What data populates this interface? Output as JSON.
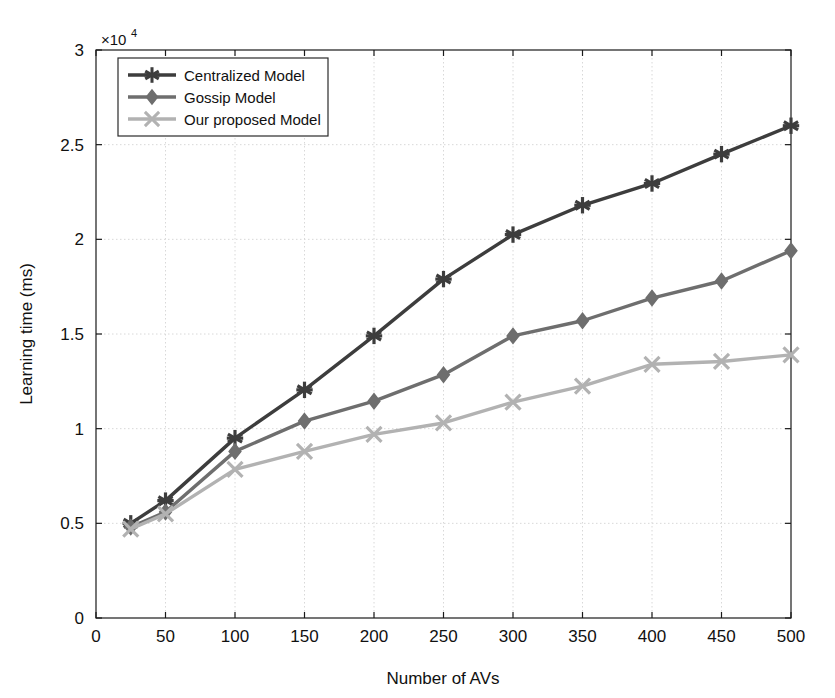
{
  "chart_data": {
    "type": "line",
    "title": "",
    "xlabel": "Number of AVs",
    "ylabel": "Learning time (ms)",
    "y_axis_exponent_label": "×10",
    "y_axis_exponent_power": "4",
    "xlim": [
      0,
      500
    ],
    "ylim": [
      0,
      30000
    ],
    "xticks": [
      0,
      50,
      100,
      150,
      200,
      250,
      300,
      350,
      400,
      450,
      500
    ],
    "xtick_labels": [
      "0",
      "50",
      "100",
      "150",
      "200",
      "250",
      "300",
      "350",
      "400",
      "450",
      "500"
    ],
    "yticks": [
      0,
      5000,
      10000,
      15000,
      20000,
      25000,
      30000
    ],
    "ytick_labels": [
      "0",
      "0.5",
      "1",
      "1.5",
      "2",
      "2.5",
      "3"
    ],
    "grid": true,
    "legend_position": "top-left",
    "x": [
      25,
      50,
      100,
      150,
      200,
      250,
      300,
      350,
      400,
      450,
      500
    ],
    "series": [
      {
        "name": "Centralized Model",
        "color": "#3d3d3d",
        "marker": "asterisk",
        "values": [
          5000,
          6200,
          9500,
          12050,
          14900,
          17900,
          20250,
          21800,
          22950,
          24500,
          26000
        ]
      },
      {
        "name": "Gossip Model",
        "color": "#6e6e6e",
        "marker": "diamond",
        "values": [
          4800,
          5600,
          8800,
          10400,
          11450,
          12850,
          14900,
          15700,
          16900,
          17800,
          19400
        ]
      },
      {
        "name": "Our proposed Model",
        "color": "#b2b2b2",
        "marker": "cross",
        "values": [
          4700,
          5500,
          7850,
          8800,
          9700,
          10300,
          11400,
          12250,
          13400,
          13550,
          13900
        ]
      }
    ]
  },
  "legend": {
    "items": [
      {
        "label": "Centralized Model"
      },
      {
        "label": "Gossip Model"
      },
      {
        "label": "Our proposed Model"
      }
    ]
  },
  "colors": {
    "axis": "#1a1a1a",
    "grid": "#d8d8d8",
    "background": "#ffffff"
  }
}
